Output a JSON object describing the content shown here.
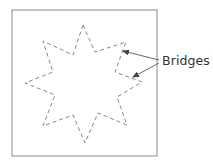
{
  "figure": {
    "type": "diagram",
    "frame": {
      "x": 12,
      "y": 10,
      "width": 145,
      "height": 146,
      "stroke": "#8a8a8a"
    },
    "star": {
      "points": 8,
      "style": "dashed",
      "stroke": "#7a7a7a",
      "vertices": [
        [
          83,
          25
        ],
        [
          95,
          52
        ],
        [
          126,
          42
        ],
        [
          115,
          72
        ],
        [
          142,
          82
        ],
        [
          117,
          97
        ],
        [
          127,
          125
        ],
        [
          98,
          113
        ],
        [
          85,
          143
        ],
        [
          73,
          115
        ],
        [
          43,
          126
        ],
        [
          55,
          95
        ],
        [
          25,
          83
        ],
        [
          53,
          72
        ],
        [
          43,
          41
        ],
        [
          73,
          55
        ]
      ]
    },
    "annotations": [
      {
        "label": "Bridges",
        "text_position": {
          "x": 162,
          "y": 53
        },
        "arrows": [
          {
            "from": [
              159,
              60
            ],
            "to": [
              123,
              51
            ]
          },
          {
            "from": [
              159,
              63
            ],
            "to": [
              133,
              77
            ]
          }
        ]
      }
    ]
  }
}
